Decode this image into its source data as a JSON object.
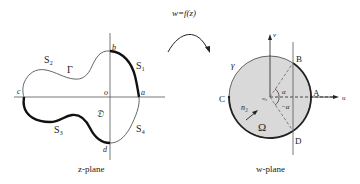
{
  "mapping": {
    "label": "w=f(z)"
  },
  "z_plane": {
    "caption": "z-plane",
    "region_label": "𝔇",
    "boundary_label": "Γ",
    "origin_label": "o",
    "points": {
      "a": "a",
      "b": "b",
      "c": "c",
      "d": "d"
    },
    "segments": {
      "s1": "S₁",
      "s2": "S₂",
      "s3": "S₃",
      "s4": "S₄"
    }
  },
  "w_plane": {
    "caption": "w-plane",
    "region_label": "Ω",
    "boundary_label": "γ",
    "axis_u": "u",
    "axis_v": "v",
    "center_label": "w₀",
    "normal_label": "n₃",
    "angle_top": "α",
    "angle_bottom": "−α",
    "points": {
      "A": "A",
      "B": "B",
      "C": "C",
      "D": "D"
    }
  },
  "colors": {
    "circle_fill": "#d9d9d9",
    "stroke": "#222222",
    "thin_stroke": "#555555"
  }
}
